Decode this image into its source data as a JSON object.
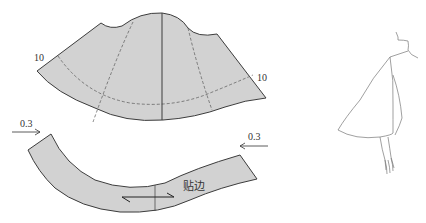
{
  "figure": {
    "type": "sewing-pattern-diagram",
    "colors": {
      "fill": "#d2d2d2",
      "stroke": "#3c3c3c",
      "dash": "#555555",
      "sketch": "#777777",
      "background": "#ffffff"
    }
  },
  "cape_piece": {
    "left_label": "10",
    "right_label": "10"
  },
  "facing_piece": {
    "left_arrow_label": "0.3",
    "right_arrow_label": "0.3",
    "facing_label": "贴边"
  },
  "illustration": {
    "subject": "figure-wearing-cape-side-view"
  }
}
